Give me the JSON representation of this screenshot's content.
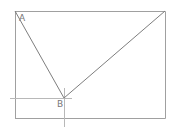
{
  "diagram": {
    "labels": {
      "a": "A",
      "b": "B"
    },
    "colors": {
      "line": "#8a8a8a",
      "frame": "#9a9a9a",
      "guide": "#b5b5b5",
      "label": "#777777"
    },
    "points": {
      "A": [
        15,
        11
      ],
      "B": [
        64,
        98
      ],
      "C": [
        165,
        11
      ]
    },
    "frame": {
      "left": 15,
      "top": 11,
      "right": 165,
      "bottom": 118
    }
  }
}
